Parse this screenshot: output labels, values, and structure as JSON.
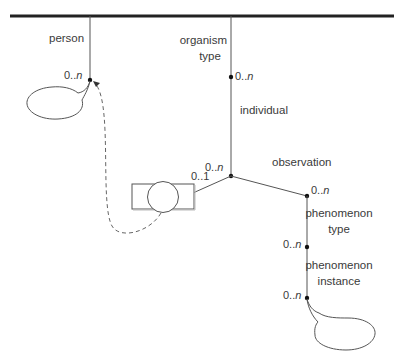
{
  "diagram": {
    "type": "tree-association-diagram",
    "root_bar": {
      "color": "#222222"
    },
    "line_color": "#555555",
    "nodes": {
      "person": {
        "label": "person",
        "cardinality_prefix": "0..",
        "cardinality_suffix": "n"
      },
      "organism_type": {
        "label_line1": "organism",
        "label_line2": "type",
        "cardinality_prefix": "0..",
        "cardinality_suffix": "n"
      },
      "individual": {
        "label": "individual",
        "cardinality_prefix": "0..",
        "cardinality_suffix": "n"
      },
      "specimen": {
        "cardinality": "0..1",
        "shape": "circle-in-rectangle"
      },
      "observation": {
        "label": "observation",
        "cardinality_prefix": "0..",
        "cardinality_suffix": "n"
      },
      "phenomenon_type": {
        "label_line1": "phenomenon",
        "label_line2": "type",
        "cardinality_prefix": "0..",
        "cardinality_suffix": "n"
      },
      "phenomenon_instance": {
        "label_line1": "phenomenon",
        "label_line2": "instance",
        "cardinality_prefix": "0..",
        "cardinality_suffix": "n"
      }
    },
    "edges": [
      {
        "from": "root",
        "to": "person"
      },
      {
        "from": "root",
        "to": "organism_type"
      },
      {
        "from": "organism_type",
        "to": "individual"
      },
      {
        "from": "individual",
        "to": "specimen"
      },
      {
        "from": "individual",
        "to": "observation"
      },
      {
        "from": "observation",
        "to": "phenomenon_type"
      },
      {
        "from": "phenomenon_type",
        "to": "phenomenon_instance"
      },
      {
        "from": "specimen",
        "to": "person",
        "style": "dashed",
        "arrow": true
      }
    ],
    "callouts": [
      "person-bubble",
      "phenomenon-instance-bubble"
    ]
  }
}
